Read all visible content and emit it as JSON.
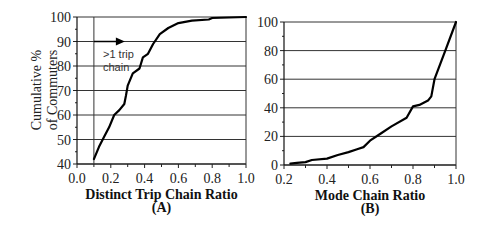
{
  "chart_data": [
    {
      "id": "A",
      "type": "line",
      "title": "",
      "xlabel": "Distinct Trip Chain Ratio",
      "panel_label": "(A)",
      "ylabel": "Cumulative % of Commuters",
      "ylabel_lines": [
        "Cumulative %",
        "of Commuters"
      ],
      "xlim": [
        0.0,
        1.0
      ],
      "ylim": [
        40,
        100
      ],
      "xticks": [
        "0.0",
        "0.2",
        "0.4",
        "0.6",
        "0.8",
        "1.0"
      ],
      "yticks": [
        "40",
        "50",
        "60",
        "70",
        "80",
        "90",
        "100"
      ],
      "grid": "horizontal",
      "vertical_reference_line_x": 0.1,
      "annotation": {
        "text_lines": [
          ">1 trip",
          "chain"
        ],
        "arrow": "right-pointing arrow from x=0.1 at y=90"
      },
      "x": [
        0.1,
        0.13,
        0.16,
        0.19,
        0.22,
        0.25,
        0.28,
        0.29,
        0.3,
        0.33,
        0.37,
        0.39,
        0.42,
        0.45,
        0.49,
        0.54,
        0.6,
        0.68,
        0.78,
        0.8,
        0.9,
        1.0
      ],
      "y": [
        42,
        47,
        51,
        55,
        60,
        62,
        64.5,
        68,
        72,
        77,
        79,
        83.5,
        85,
        89,
        93,
        95.5,
        97.5,
        98.5,
        99,
        99.6,
        99.8,
        100
      ]
    },
    {
      "id": "B",
      "type": "line",
      "title": "",
      "xlabel": "Mode Chain Ratio",
      "panel_label": "(B)",
      "ylabel": "",
      "xlim": [
        0.2,
        1.0
      ],
      "ylim": [
        0,
        100
      ],
      "xticks": [
        "0.2",
        "0.4",
        "0.6",
        "0.8",
        "1.0"
      ],
      "yticks": [
        "0",
        "20",
        "40",
        "60",
        "80",
        "100"
      ],
      "grid": "horizontal",
      "x": [
        0.23,
        0.26,
        0.3,
        0.33,
        0.4,
        0.45,
        0.5,
        0.54,
        0.57,
        0.6,
        0.65,
        0.7,
        0.77,
        0.8,
        0.83,
        0.87,
        0.885,
        0.9,
        0.95,
        1.0
      ],
      "y": [
        1,
        1.5,
        2,
        3.5,
        4.5,
        7,
        9,
        11,
        12.5,
        17,
        22,
        27,
        33,
        41,
        42,
        45,
        48,
        60,
        80,
        100
      ]
    }
  ]
}
